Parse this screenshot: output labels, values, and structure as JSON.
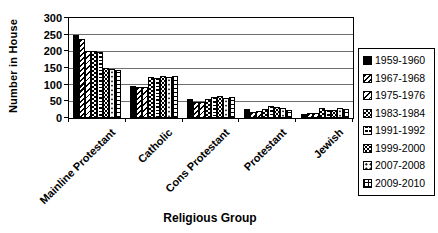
{
  "chart_data": {
    "type": "bar",
    "title": "",
    "xlabel": "Religious Group",
    "ylabel": "Number in House",
    "ylim": [
      0,
      300
    ],
    "yticks": [
      0,
      50,
      100,
      150,
      200,
      250,
      300
    ],
    "grid": true,
    "legend_position": "right",
    "categories": [
      "Mainline Protestant",
      "Catholic",
      "Cons Protestant",
      "Protestant",
      "Jewish"
    ],
    "series": [
      {
        "name": "1959-1960",
        "pattern": "solid-black",
        "values": [
          248,
          96,
          56,
          27,
          11
        ]
      },
      {
        "name": "1967-1968",
        "pattern": "diagonal-heavy",
        "values": [
          238,
          94,
          49,
          19,
          14
        ]
      },
      {
        "name": "1975-1976",
        "pattern": "diagonal-light",
        "values": [
          200,
          94,
          49,
          20,
          15
        ]
      },
      {
        "name": "1983-1984",
        "pattern": "checker",
        "values": [
          200,
          123,
          56,
          26,
          30
        ]
      },
      {
        "name": "1991-1992",
        "pattern": "brick",
        "values": [
          198,
          121,
          63,
          35,
          23
        ]
      },
      {
        "name": "1999-2000",
        "pattern": "diamond-dots",
        "values": [
          150,
          125,
          66,
          32,
          23
        ]
      },
      {
        "name": "2007-2008",
        "pattern": "dots",
        "values": [
          146,
          124,
          61,
          29,
          30
        ]
      },
      {
        "name": "2009-2010",
        "pattern": "grid",
        "values": [
          145,
          126,
          64,
          25,
          28
        ]
      }
    ]
  }
}
